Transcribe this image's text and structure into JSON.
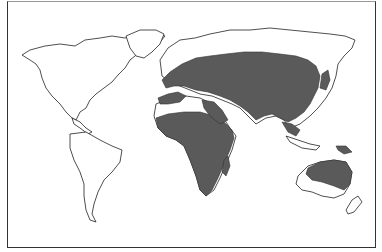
{
  "map": {
    "type": "world distribution map",
    "legend": [],
    "colors": {
      "background": "#ffffff",
      "land_outline": "#222222",
      "range_fill": "#5a5a5a"
    },
    "regions_shaded": [
      "Europe (southern)",
      "North Africa (coast)",
      "Sub-Saharan Africa",
      "Madagascar",
      "Middle East",
      "Central Asia",
      "South Asia",
      "East Asia",
      "Southeast Asia",
      "Japan",
      "New Guinea",
      "Australia (north & east)"
    ],
    "regions_unshaded": [
      "North America",
      "South America",
      "Greenland",
      "Sahara",
      "Scandinavia (north)",
      "Siberia (north)",
      "New Zealand",
      "Australia (southwest)"
    ]
  }
}
